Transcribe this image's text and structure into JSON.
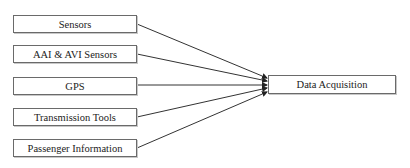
{
  "diagram": {
    "type": "flow",
    "sources": [
      {
        "id": "sensors",
        "label": "Sensors"
      },
      {
        "id": "aai-avi-sensors",
        "label": "AAI & AVI Sensors"
      },
      {
        "id": "gps",
        "label": "GPS"
      },
      {
        "id": "transmission-tools",
        "label": "Transmission Tools"
      },
      {
        "id": "passenger-information",
        "label": "Passenger Information"
      }
    ],
    "target": {
      "id": "data-acquisition",
      "label": "Data Acquisition"
    },
    "edges": [
      {
        "from": "sensors",
        "to": "data-acquisition"
      },
      {
        "from": "aai-avi-sensors",
        "to": "data-acquisition"
      },
      {
        "from": "gps",
        "to": "data-acquisition"
      },
      {
        "from": "transmission-tools",
        "to": "data-acquisition"
      },
      {
        "from": "passenger-information",
        "to": "data-acquisition"
      }
    ],
    "colors": {
      "line": "#333333",
      "border": "#6a6a6a",
      "text": "#222222",
      "background": "#ffffff"
    }
  }
}
